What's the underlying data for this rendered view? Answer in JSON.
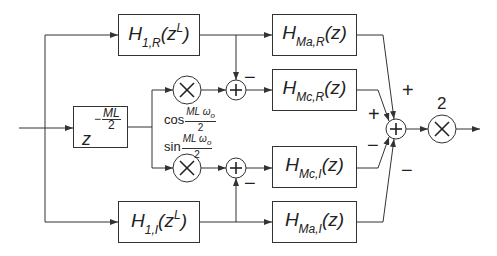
{
  "diagram": {
    "type": "signal-flow block diagram",
    "input_label": "",
    "delay_block": {
      "base": "z",
      "exponent_sign": "−",
      "exponent_num": "ML",
      "exponent_den": "2"
    },
    "blocks": {
      "h1r": {
        "H": "H",
        "sub": "1,R",
        "arg_open": "(z",
        "arg_sup": "L",
        "arg_close": ")"
      },
      "h1i": {
        "H": "H",
        "sub": "1,I",
        "arg_open": "(z",
        "arg_sup": "L",
        "arg_close": ")"
      },
      "hmar": {
        "H": "H",
        "sub": "Ma,R",
        "arg": "(z)"
      },
      "hmcr": {
        "H": "H",
        "sub": "Mc,R",
        "arg": "(z)"
      },
      "hmci": {
        "H": "H",
        "sub": "Mc,I",
        "arg": "(z)"
      },
      "hmai": {
        "H": "H",
        "sub": "Ma,I",
        "arg": "(z)"
      }
    },
    "modulators": {
      "cos": {
        "fn": "cos",
        "num": "ML ω",
        "num_sub": "o",
        "den": "2"
      },
      "sin": {
        "fn": "sin",
        "num": "ML ω",
        "num_sub": "o",
        "den": "2"
      }
    },
    "signs": {
      "top_adder_minus": "−",
      "bottom_adder_minus": "−",
      "final_from_hmar": "+",
      "final_from_hmcr": "+",
      "final_from_hmci": "−",
      "final_from_hmai": "−"
    },
    "gain": "2",
    "colors": {
      "line": "#333333",
      "background": "#ffffff"
    }
  }
}
